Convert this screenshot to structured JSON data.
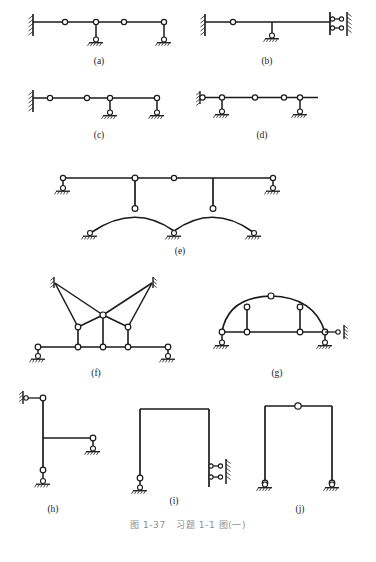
{
  "document": {
    "caption": "图 1-37   习题 1-1 图(一)",
    "caption_figure_number": "图 1-37",
    "caption_title": "习题 1-1 图(一)",
    "background_color": "#ffffff",
    "line_color": "#1a1a1a",
    "caption_color": "#8d8d8d"
  },
  "panels": [
    {
      "id": "a",
      "label": "(a)",
      "description": "Horizontal compound beam: fixed wall support at left, three internal hinges, two roller supports on short vertical links"
    },
    {
      "id": "b",
      "label": "(b)",
      "description": "Horizontal beam: fixed wall support at left, one internal hinge, roller support on vertical link, right end vertical member with two horizontal link bars to hatched wall"
    },
    {
      "id": "c",
      "label": "(c)",
      "description": "Horizontal compound beam: fixed wall support at left, three internal hinges, two roller supports on vertical links"
    },
    {
      "id": "d",
      "label": "(d)",
      "description": "Horizontal beam: pin on hatched wall at left, two roller supports on vertical links, two internal hinges, free cantilever right end"
    },
    {
      "id": "e",
      "label": "(e)",
      "description": "Top horizontal beam on two end roller links with an internal hinge, carried by two vertical columns down to two curved arches springing from three roller supports"
    },
    {
      "id": "f",
      "label": "(f)",
      "description": "Cable-stayed style frame: two elevated hatched wall anchors with crossing diagonal members meeting at a central apex hinge, three vertical posts to a horizontal bottom beam with two roller supports"
    },
    {
      "id": "g",
      "label": "(g)",
      "description": "Tied arch: curved arch rib with crown hinge and two vertical hangers to a horizontal tie beam, roller support left, roller support right plus a horizontal link to hatched wall"
    },
    {
      "id": "h",
      "label": "(h)",
      "description": "T-shaped frame: vertical column with top hinge linked to hatched wall, horizontal cantilever arm to a roller support, lower hinge and roller support at column base"
    },
    {
      "id": "i",
      "label": "(i)",
      "description": "Portal frame: left column on hinge and roller support, right column attached to a hatched wall by two horizontal link bars"
    },
    {
      "id": "j",
      "label": "(j)",
      "description": "Three-hinged portal frame: crown hinge at mid-span of the top beam and pin-roller supports at both column bases"
    }
  ],
  "legend": {
    "hinge_symbol": "open-circle-hinge",
    "roller_support_symbol": "pin-on-hatched-ground",
    "fixed_wall_symbol": "hatched-vertical-wall",
    "link_support_symbol": "horizontal-link-bar"
  }
}
